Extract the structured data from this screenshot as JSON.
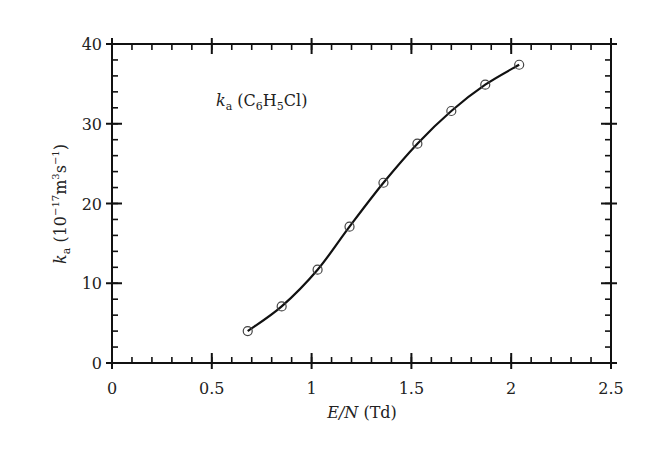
{
  "chart_data": {
    "type": "line",
    "title": "",
    "annotation": {
      "main": "k",
      "sub": "a",
      "text_parts": [
        " (C",
        "6",
        "H",
        "5",
        "Cl)"
      ]
    },
    "xlabel": {
      "italic": "E/N",
      "rest": " (Td)"
    },
    "ylabel": {
      "italic": "k",
      "sub": "a",
      "rest_parts": [
        " (10",
        "−17",
        "m",
        "3",
        "s",
        "−1",
        ")"
      ]
    },
    "xlim": [
      0,
      2.5
    ],
    "ylim": [
      0,
      40
    ],
    "x_ticks": [
      0,
      0.5,
      1,
      1.5,
      2,
      2.5
    ],
    "x_tick_labels": [
      "0",
      "0.5",
      "1",
      "1.5",
      "2",
      "2.5"
    ],
    "y_ticks": [
      0,
      10,
      20,
      30,
      40
    ],
    "y_tick_labels": [
      "0",
      "10",
      "20",
      "30",
      "40"
    ],
    "x_minor_step": 0.1,
    "y_minor_step": 2,
    "grid": false,
    "legend": null,
    "series": [
      {
        "name": "k_a (C6H5Cl)",
        "marker": "open-circle",
        "line": "smooth",
        "color": "#111111",
        "x": [
          0.68,
          0.85,
          1.03,
          1.19,
          1.36,
          1.53,
          1.7,
          1.87,
          2.04
        ],
        "y": [
          4.0,
          7.1,
          11.7,
          17.1,
          22.6,
          27.5,
          31.6,
          34.9,
          37.4
        ]
      }
    ]
  }
}
